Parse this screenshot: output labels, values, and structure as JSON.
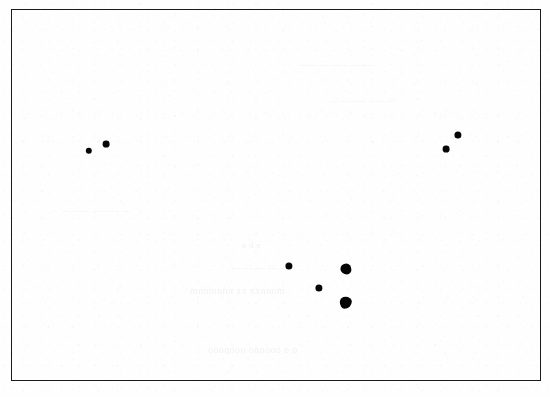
{
  "figure": {
    "background_color": "#fefefe",
    "frame_color": "#1b1b1b",
    "marker_color": "#060606",
    "width": 550,
    "height": 397
  },
  "ghost_text": [
    {
      "text": "a   d       e",
      "x": 242,
      "y": 240,
      "size": 9
    },
    {
      "text": "— — — — —",
      "x": 232,
      "y": 262,
      "size": 9
    },
    {
      "text": "mmnnnnn xx xxnnnm",
      "x": 190,
      "y": 285,
      "size": 10
    },
    {
      "text": "ooooooo oooooo  o o",
      "x": 208,
      "y": 344,
      "size": 10
    },
    {
      "text": "—  —— ——  — —",
      "x": 62,
      "y": 206,
      "size": 8
    },
    {
      "text": "—— — ——  ———",
      "x": 300,
      "y": 60,
      "size": 8
    },
    {
      "text": "— ———  —— —",
      "x": 330,
      "y": 96,
      "size": 8
    }
  ],
  "chart_data": {
    "type": "scatter",
    "title": "",
    "subtitle": "",
    "xlabel": "",
    "ylabel": "",
    "xlim": [
      0,
      530
    ],
    "ylim": [
      0,
      372
    ],
    "grid": false,
    "axis_ticks": false,
    "tick_labels": [],
    "legend": [],
    "legend_position": "none",
    "annotations": [],
    "series": [
      {
        "name": "markers",
        "marker": "filled-circle",
        "color": "#060606",
        "points": [
          {
            "id": "p1",
            "x": 77,
            "y": 141,
            "r": 3.2,
            "shape": "round"
          },
          {
            "id": "p2",
            "x": 94,
            "y": 134,
            "r": 3.4,
            "shape": "round"
          },
          {
            "id": "p3",
            "x": 446,
            "y": 125,
            "r": 3.6,
            "shape": "round"
          },
          {
            "id": "p4",
            "x": 434,
            "y": 139,
            "r": 3.4,
            "shape": "round"
          },
          {
            "id": "p5",
            "x": 277,
            "y": 256,
            "r": 3.6,
            "shape": "round"
          },
          {
            "id": "p6",
            "x": 334,
            "y": 259,
            "r": 5.6,
            "shape": "blot-a"
          },
          {
            "id": "p7",
            "x": 307,
            "y": 278,
            "r": 3.6,
            "shape": "round"
          },
          {
            "id": "p8",
            "x": 334,
            "y": 293,
            "r": 6.2,
            "shape": "blot-b"
          }
        ]
      }
    ]
  }
}
